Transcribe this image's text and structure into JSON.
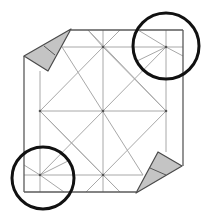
{
  "diagram": {
    "title": "",
    "type": "origami crease pattern step",
    "colors": {
      "background": "#ffffff",
      "crease": "#a8a8a8",
      "edge": "#5a5a5a",
      "flap_fill": "#c4c4c4",
      "highlight_circle": "#111111"
    },
    "edges": [
      [
        24,
        56,
        24,
        192
      ],
      [
        24,
        192,
        136,
        192
      ],
      [
        71,
        30,
        183,
        30
      ],
      [
        183,
        30,
        183,
        166
      ]
    ],
    "creases": [
      [
        40,
        71,
        40,
        192
      ],
      [
        166,
        30,
        166,
        152
      ],
      [
        62,
        47,
        183,
        47
      ],
      [
        24,
        175,
        143,
        175
      ],
      [
        103,
        30,
        103,
        192
      ],
      [
        40,
        111,
        166,
        111
      ],
      [
        103,
        47,
        166,
        111
      ],
      [
        166,
        111,
        103,
        175
      ],
      [
        103,
        175,
        40,
        111
      ],
      [
        40,
        111,
        103,
        47
      ],
      [
        62,
        47,
        143,
        175
      ],
      [
        166,
        47,
        40,
        175
      ],
      [
        88,
        30,
        103,
        47
      ],
      [
        120,
        30,
        103,
        47
      ],
      [
        86,
        192,
        103,
        175
      ],
      [
        120,
        192,
        103,
        175
      ],
      [
        88,
        30,
        166,
        111
      ],
      [
        120,
        192,
        40,
        111
      ],
      [
        138,
        30,
        166,
        47
      ],
      [
        166,
        47,
        183,
        56
      ],
      [
        24,
        165,
        40,
        175
      ],
      [
        40,
        175,
        64,
        192
      ],
      [
        40,
        175,
        70,
        160
      ],
      [
        166,
        47,
        135,
        62
      ]
    ],
    "points": [
      [
        103,
        47
      ],
      [
        166,
        47
      ],
      [
        40,
        111
      ],
      [
        103,
        111
      ],
      [
        166,
        111
      ],
      [
        40,
        175
      ],
      [
        103,
        175
      ]
    ],
    "flaps": [
      {
        "name": "top-left-flap",
        "polygon": [
          [
            71,
            29
          ],
          [
            24,
            56
          ],
          [
            48,
            71
          ]
        ],
        "inner_line": [
          44,
          46,
          55,
          55
        ]
      },
      {
        "name": "bottom-right-flap",
        "polygon": [
          [
            158,
            152
          ],
          [
            182,
            166
          ],
          [
            136,
            193
          ]
        ],
        "inner_line": [
          150,
          168,
          166,
          175
        ]
      }
    ],
    "highlights": [
      {
        "name": "top-right-circle",
        "cx": 166,
        "cy": 46,
        "r": 33
      },
      {
        "name": "bottom-left-circle",
        "cx": 43,
        "cy": 178,
        "r": 31
      }
    ]
  }
}
